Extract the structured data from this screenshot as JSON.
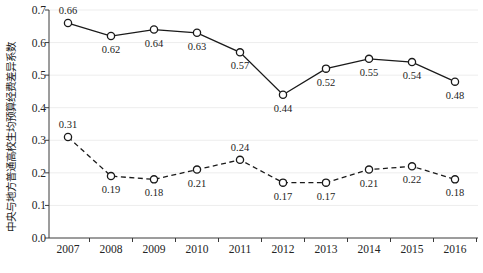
{
  "chart_data": {
    "type": "line",
    "title": "",
    "subtitle": "",
    "xlabel": "",
    "ylabel": "中央与地方普通高校生均预算经费差异系数",
    "categories": [
      "2007",
      "2008",
      "2009",
      "2010",
      "2011",
      "2012",
      "2013",
      "2014",
      "2015",
      "2016"
    ],
    "x": [
      2007,
      2008,
      2009,
      2010,
      2011,
      2012,
      2013,
      2014,
      2015,
      2016
    ],
    "ylim": [
      0.0,
      0.7
    ],
    "ytick_step": 0.1,
    "yticks": [
      "0.0",
      "0.1",
      "0.2",
      "0.3",
      "0.4",
      "0.5",
      "0.6",
      "0.7"
    ],
    "ytick_values": [
      0.0,
      0.1,
      0.2,
      0.3,
      0.4,
      0.5,
      0.6,
      0.7
    ],
    "grid": true,
    "grid_color": "#ededed",
    "legend": "none",
    "legend_position": "none",
    "axis_color": "#3a3a3a",
    "series": [
      {
        "name": "upper-series",
        "style": "solid",
        "marker": "open-circle",
        "color": "#1a1a1a",
        "values": [
          0.66,
          0.62,
          0.64,
          0.63,
          0.57,
          0.44,
          0.52,
          0.55,
          0.54,
          0.48
        ],
        "labels": [
          "0.66",
          "0.62",
          "0.64",
          "0.63",
          "0.57",
          "0.44",
          "0.52",
          "0.55",
          "0.54",
          "0.48"
        ],
        "label_positions": [
          "above",
          "below",
          "below",
          "below",
          "below",
          "below",
          "below",
          "below",
          "below",
          "below"
        ]
      },
      {
        "name": "lower-series",
        "style": "dashed",
        "marker": "open-circle",
        "color": "#1a1a1a",
        "values": [
          0.31,
          0.19,
          0.18,
          0.21,
          0.24,
          0.17,
          0.17,
          0.21,
          0.22,
          0.18
        ],
        "labels": [
          "0.31",
          "0.19",
          "0.18",
          "0.21",
          "0.24",
          "0.17",
          "0.17",
          "0.21",
          "0.22",
          "0.18"
        ],
        "label_positions": [
          "above",
          "below",
          "below",
          "below",
          "above",
          "below",
          "below",
          "below",
          "below",
          "below"
        ]
      }
    ]
  }
}
